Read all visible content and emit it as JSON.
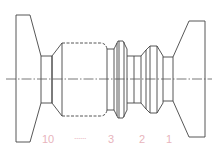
{
  "diagram": {
    "type": "mechanical-part-outline",
    "stroke_color": "#444444",
    "label_color": "#e8b4bc",
    "centerline": {
      "y": 79,
      "x1": 6,
      "x2": 212,
      "style": "dash-dot"
    },
    "labels": [
      {
        "text": "10",
        "x": 48,
        "y": 134
      },
      {
        "text": "......",
        "x": 80,
        "y": 132
      },
      {
        "text": "3",
        "x": 111,
        "y": 134
      },
      {
        "text": "2",
        "x": 142,
        "y": 134
      },
      {
        "text": "1",
        "x": 169,
        "y": 134
      }
    ]
  }
}
